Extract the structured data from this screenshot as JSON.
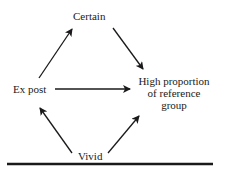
{
  "diagram": {
    "nodes": {
      "certain": "Certain",
      "ex_post": "Ex post",
      "vivid": "Vivid",
      "target": {
        "line1": "High proportion",
        "line2": "of reference",
        "line3": "group"
      }
    },
    "edges": [
      {
        "from": "Ex post",
        "to": "Certain"
      },
      {
        "from": "Certain",
        "to": "High proportion of reference group"
      },
      {
        "from": "Ex post",
        "to": "High proportion of reference group"
      },
      {
        "from": "Vivid",
        "to": "Ex post"
      },
      {
        "from": "Vivid",
        "to": "High proportion of reference group"
      }
    ],
    "colors": {
      "ink": "#1a1a1a",
      "background": "#ffffff"
    }
  }
}
